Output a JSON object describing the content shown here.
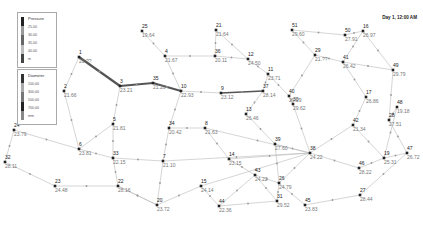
{
  "timestamp": "Day 1, 12:00 AM",
  "legend": {
    "pressure": {
      "title": "Pressure",
      "ticks": [
        "25.00",
        "30.00",
        "35.00",
        "40.00"
      ],
      "unit": "m"
    },
    "diameter": {
      "title": "Diameter",
      "ticks": [
        "100.00",
        "300.00",
        "500.00",
        "700.00"
      ],
      "unit": "mm"
    }
  },
  "colors": {
    "link": "#b8b8b8",
    "link_thick": "#555555",
    "node": "#222222",
    "label_id": "#222222",
    "label_value": "#777777"
  },
  "nodes": [
    {
      "id": "1",
      "x": 79,
      "y": 57,
      "value": "20.??"
    },
    {
      "id": "2",
      "x": 64,
      "y": 91,
      "value": "21.66"
    },
    {
      "id": "3",
      "x": 120,
      "y": 86,
      "value": "23.21"
    },
    {
      "id": "4",
      "x": 165,
      "y": 56,
      "value": "21.67"
    },
    {
      "id": "5",
      "x": 113,
      "y": 124,
      "value": "21.81"
    },
    {
      "id": "6",
      "x": 79,
      "y": 149,
      "value": "23.81"
    },
    {
      "id": "7",
      "x": 163,
      "y": 161,
      "value": "21.10"
    },
    {
      "id": "8",
      "x": 205,
      "y": 128,
      "value": "21.63"
    },
    {
      "id": "9",
      "x": 221,
      "y": 93,
      "value": "23.12"
    },
    {
      "id": "10",
      "x": 181,
      "y": 91,
      "value": "22.93"
    },
    {
      "id": "11",
      "x": 268,
      "y": 74,
      "value": "23.71"
    },
    {
      "id": "12",
      "x": 248,
      "y": 59,
      "value": "24.50"
    },
    {
      "id": "13",
      "x": 246,
      "y": 114,
      "value": "26.46"
    },
    {
      "id": "14",
      "x": 229,
      "y": 159,
      "value": "23.15"
    },
    {
      "id": "15",
      "x": 201,
      "y": 186,
      "value": "24.14"
    },
    {
      "id": "16",
      "x": 363,
      "y": 31,
      "value": "26.97"
    },
    {
      "id": "17",
      "x": 366,
      "y": 97,
      "value": "26.86"
    },
    {
      "id": "19",
      "x": 384,
      "y": 158,
      "value": "25.31"
    },
    {
      "id": "20",
      "x": 157,
      "y": 205,
      "value": "23.72"
    },
    {
      "id": "21",
      "x": 216,
      "y": 30,
      "value": "21.64"
    },
    {
      "id": "22",
      "x": 118,
      "y": 186,
      "value": "28.16"
    },
    {
      "id": "23",
      "x": 55,
      "y": 186,
      "value": "24.48"
    },
    {
      "id": "24",
      "x": 14,
      "y": 130,
      "value": "23.79"
    },
    {
      "id": "25",
      "x": 142,
      "y": 31,
      "value": "19.64"
    },
    {
      "id": "26",
      "x": 279,
      "y": 183,
      "value": "24.79"
    },
    {
      "id": "27",
      "x": 360,
      "y": 195,
      "value": "28.44"
    },
    {
      "id": "28",
      "x": 389,
      "y": 120,
      "value": "27.51"
    },
    {
      "id": "29",
      "x": 315,
      "y": 55,
      "value": "21.??"
    },
    {
      "id": "30",
      "x": 293,
      "y": 104,
      "value": "29.62"
    },
    {
      "id": "31",
      "x": 277,
      "y": 201,
      "value": "29.52"
    },
    {
      "id": "32",
      "x": 5,
      "y": 162,
      "value": "28.11"
    },
    {
      "id": "33",
      "x": 113,
      "y": 158,
      "value": "22.15"
    },
    {
      "id": "34",
      "x": 169,
      "y": 128,
      "value": "20.42"
    },
    {
      "id": "35",
      "x": 153,
      "y": 83,
      "value": "21.20"
    },
    {
      "id": "36",
      "x": 215,
      "y": 56,
      "value": "20.11"
    },
    {
      "id": "37",
      "x": 263,
      "y": 91,
      "value": "28.14"
    },
    {
      "id": "38",
      "x": 310,
      "y": 153,
      "value": "24.22"
    },
    {
      "id": "39",
      "x": 275,
      "y": 144,
      "value": "27.60"
    },
    {
      "id": "40",
      "x": 289,
      "y": 96,
      "value": "29.29"
    },
    {
      "id": "41",
      "x": 343,
      "y": 62,
      "value": "26.42"
    },
    {
      "id": "42",
      "x": 353,
      "y": 125,
      "value": "21.34"
    },
    {
      "id": "43",
      "x": 255,
      "y": 175,
      "value": "24.22"
    },
    {
      "id": "44",
      "x": 219,
      "y": 206,
      "value": "22.36"
    },
    {
      "id": "45",
      "x": 305,
      "y": 205,
      "value": "23.83"
    },
    {
      "id": "46",
      "x": 359,
      "y": 168,
      "value": "28.22"
    },
    {
      "id": "47",
      "x": 407,
      "y": 153,
      "value": "26.72"
    },
    {
      "id": "48",
      "x": 397,
      "y": 107,
      "value": "19.18"
    },
    {
      "id": "49",
      "x": 393,
      "y": 70,
      "value": "29.79"
    },
    {
      "id": "50",
      "x": 345,
      "y": 35,
      "value": "27.91"
    },
    {
      "id": "51",
      "x": 292,
      "y": 30,
      "value": "29.60"
    }
  ],
  "links": [
    [
      "1",
      "3",
      2.2
    ],
    [
      "1",
      "2",
      0.6
    ],
    [
      "2",
      "6",
      0.6
    ],
    [
      "3",
      "35",
      2
    ],
    [
      "35",
      "10",
      2
    ],
    [
      "3",
      "5",
      0.6
    ],
    [
      "5",
      "6",
      0.6
    ],
    [
      "5",
      "33",
      0.6
    ],
    [
      "6",
      "33",
      0.6
    ],
    [
      "24",
      "6",
      0.6
    ],
    [
      "24",
      "32",
      0.6
    ],
    [
      "32",
      "23",
      0.6
    ],
    [
      "23",
      "22",
      0.6
    ],
    [
      "33",
      "22",
      0.6
    ],
    [
      "33",
      "7",
      0.6
    ],
    [
      "22",
      "20",
      0.6
    ],
    [
      "7",
      "20",
      0.6
    ],
    [
      "7",
      "34",
      0.6
    ],
    [
      "34",
      "10",
      0.6
    ],
    [
      "34",
      "8",
      0.6
    ],
    [
      "8",
      "38",
      0.6
    ],
    [
      "7",
      "38",
      0.6
    ],
    [
      "8",
      "14",
      0.6
    ],
    [
      "38",
      "14",
      0.6
    ],
    [
      "38",
      "15",
      0.6
    ],
    [
      "15",
      "20",
      0.6
    ],
    [
      "15",
      "44",
      0.6
    ],
    [
      "44",
      "43",
      0.6
    ],
    [
      "44",
      "31",
      0.6
    ],
    [
      "31",
      "43",
      0.6
    ],
    [
      "14",
      "43",
      0.6
    ],
    [
      "43",
      "26",
      0.6
    ],
    [
      "10",
      "4",
      0.6
    ],
    [
      "25",
      "4",
      0.6
    ],
    [
      "4",
      "36",
      0.6
    ],
    [
      "36",
      "21",
      0.6
    ],
    [
      "21",
      "12",
      0.6
    ],
    [
      "36",
      "12",
      0.6
    ],
    [
      "10",
      "9",
      0.6
    ],
    [
      "9",
      "37",
      1.6
    ],
    [
      "37",
      "11",
      0.6
    ],
    [
      "12",
      "11",
      0.6
    ],
    [
      "37",
      "13",
      0.6
    ],
    [
      "13",
      "39",
      0.6
    ],
    [
      "11",
      "40",
      0.6
    ],
    [
      "40",
      "29",
      0.6
    ],
    [
      "29",
      "51",
      0.6
    ],
    [
      "29",
      "41",
      0.6
    ],
    [
      "51",
      "50",
      0.6
    ],
    [
      "50",
      "16",
      0.6
    ],
    [
      "16",
      "41",
      0.6
    ],
    [
      "16",
      "49",
      0.6
    ],
    [
      "41",
      "49",
      0.6
    ],
    [
      "41",
      "17",
      0.6
    ],
    [
      "17",
      "42",
      0.6
    ],
    [
      "49",
      "28",
      0.6
    ],
    [
      "28",
      "47",
      0.6
    ],
    [
      "48",
      "19",
      0.6
    ],
    [
      "48",
      "28",
      0.6
    ],
    [
      "19",
      "47",
      0.6
    ],
    [
      "19",
      "46",
      0.6
    ],
    [
      "42",
      "38",
      0.6
    ],
    [
      "42",
      "19",
      0.6
    ],
    [
      "39",
      "38",
      0.6
    ],
    [
      "39",
      "26",
      0.6
    ],
    [
      "30",
      "38",
      0.6
    ],
    [
      "40",
      "30",
      0.6
    ],
    [
      "38",
      "46",
      0.6
    ],
    [
      "38",
      "26",
      0.6
    ],
    [
      "26",
      "45",
      0.6
    ],
    [
      "45",
      "27",
      0.6
    ],
    [
      "47",
      "27",
      0.6
    ],
    [
      "26",
      "31",
      0.6
    ],
    [
      "22",
      "20",
      0.6
    ]
  ]
}
